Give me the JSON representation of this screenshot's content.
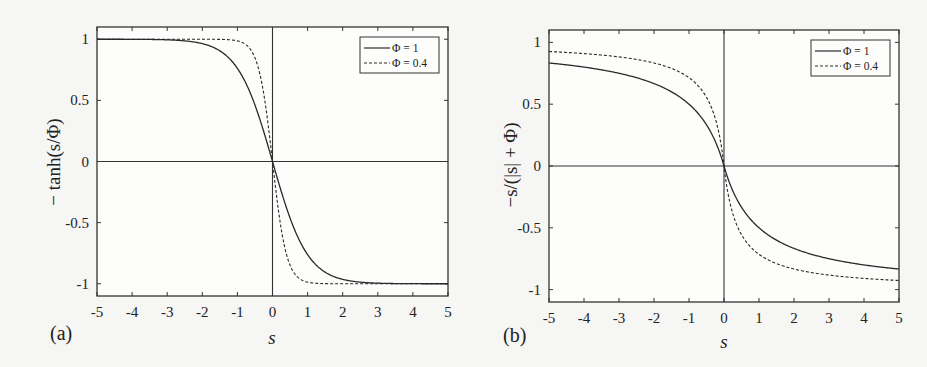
{
  "chart_data": [
    {
      "type": "line",
      "panel_label": "(a)",
      "xlabel": "s",
      "ylabel": "− tanh(s/Φ)",
      "xlim": [
        -5,
        5
      ],
      "ylim": [
        -1.1,
        1.1
      ],
      "xticks": [
        "-5",
        "-4",
        "-3",
        "-2",
        "-1",
        "0",
        "1",
        "2",
        "3",
        "4",
        "5"
      ],
      "yticks": [
        "1",
        "0.5",
        "0",
        "-0.5",
        "-1"
      ],
      "ytick_values": [
        1,
        0.5,
        0,
        -0.5,
        -1
      ],
      "grid": false,
      "legend_position": "top-right",
      "function": "neg_tanh",
      "series": [
        {
          "name": "Φ = 1",
          "phi": 1,
          "style": "solid",
          "x": [
            -5,
            -4,
            -3,
            -2,
            -1,
            0,
            1,
            2,
            3,
            4,
            5
          ],
          "y": [
            1.0,
            0.999,
            0.995,
            0.964,
            0.762,
            0,
            -0.762,
            -0.964,
            -0.995,
            -0.999,
            -1.0
          ]
        },
        {
          "name": "Φ = 0.4",
          "phi": 0.4,
          "style": "dashed",
          "x": [
            -5,
            -4,
            -3,
            -2,
            -1,
            0,
            1,
            2,
            3,
            4,
            5
          ],
          "y": [
            1.0,
            1.0,
            1.0,
            1.0,
            0.987,
            0,
            -0.987,
            -1.0,
            -1.0,
            -1.0,
            -1.0
          ]
        }
      ]
    },
    {
      "type": "line",
      "panel_label": "(b)",
      "xlabel": "s",
      "ylabel": "−s/(|s| + Φ)",
      "xlim": [
        -5,
        5
      ],
      "ylim": [
        -1.1,
        1.1
      ],
      "xticks": [
        "-5",
        "-4",
        "-3",
        "-2",
        "-1",
        "0",
        "1",
        "2",
        "3",
        "4",
        "5"
      ],
      "yticks": [
        "1",
        "0.5",
        "0",
        "-0.5",
        "-1"
      ],
      "ytick_values": [
        1,
        0.5,
        0,
        -0.5,
        -1
      ],
      "grid": false,
      "legend_position": "top-right",
      "function": "neg_rational",
      "series": [
        {
          "name": "Φ = 1",
          "phi": 1,
          "style": "solid",
          "x": [
            -5,
            -4,
            -3,
            -2,
            -1,
            0,
            1,
            2,
            3,
            4,
            5
          ],
          "y": [
            0.833,
            0.8,
            0.75,
            0.667,
            0.5,
            0,
            -0.5,
            -0.667,
            -0.75,
            -0.8,
            -0.833
          ]
        },
        {
          "name": "Φ = 0.4",
          "phi": 0.4,
          "style": "dashed",
          "x": [
            -5,
            -4,
            -3,
            -2,
            -1,
            0,
            1,
            2,
            3,
            4,
            5
          ],
          "y": [
            0.926,
            0.909,
            0.882,
            0.833,
            0.714,
            0,
            -0.714,
            -0.833,
            -0.882,
            -0.909,
            -0.926
          ]
        }
      ]
    }
  ]
}
